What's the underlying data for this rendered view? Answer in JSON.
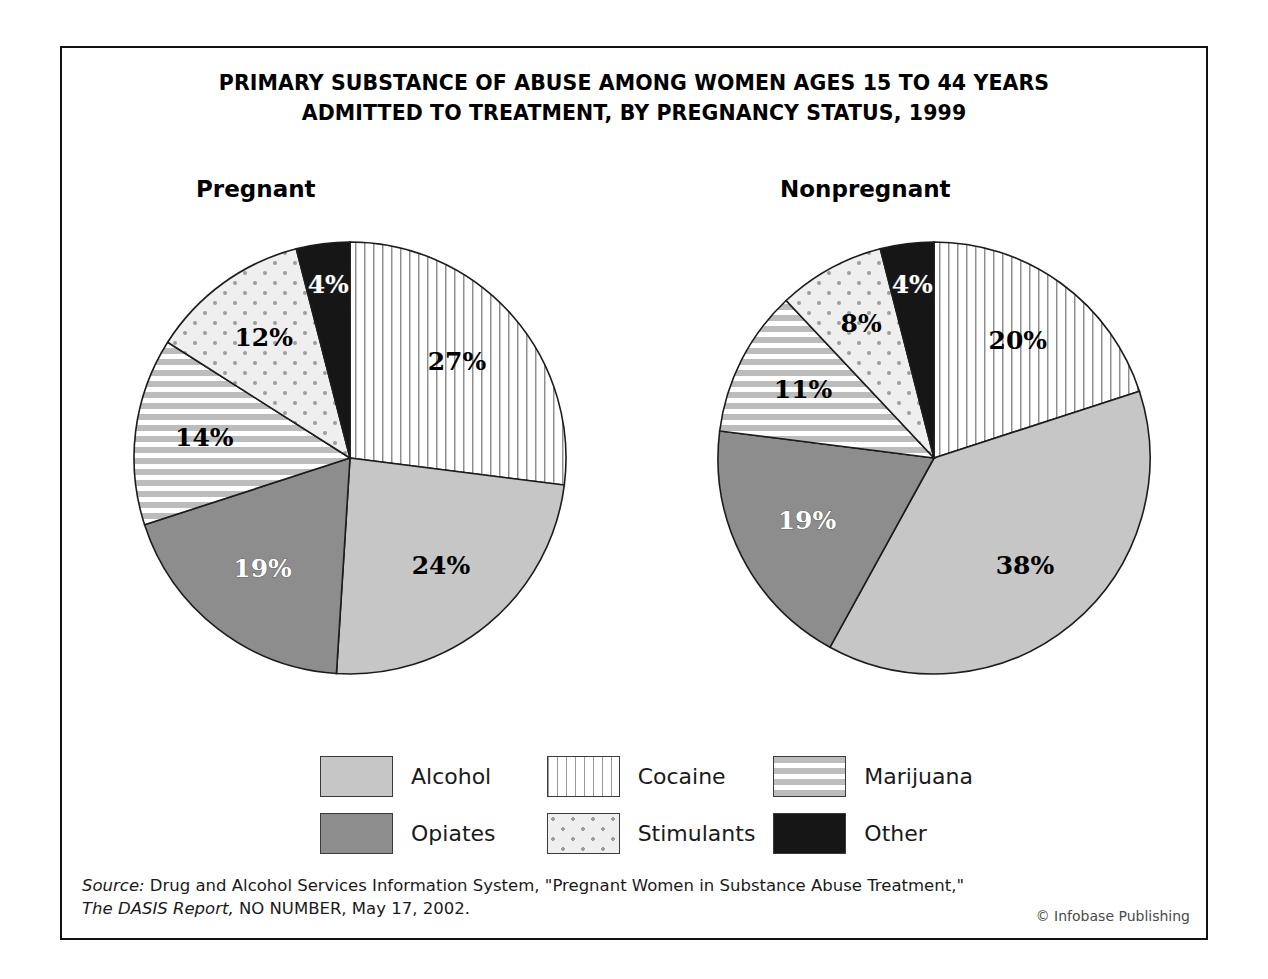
{
  "figure": {
    "title_line1": "PRIMARY SUBSTANCE OF ABUSE AMONG WOMEN AGES 15 TO 44 YEARS",
    "title_line2": "ADMITTED TO TREATMENT, BY PREGNANCY STATUS, 1999",
    "source_line1_label": "Source:",
    "source_line1_text": " Drug and Alcohol Services Information System, \"Pregnant Women in Substance Abuse Treatment,\"",
    "source_line2_italic": "The DASIS Report,",
    "source_line2_text": " NO NUMBER, May 17, 2002.",
    "credit": "© Infobase Publishing"
  },
  "legend": {
    "items": [
      {
        "label": "Alcohol",
        "swatch": "alcohol",
        "color": "#c6c6c6"
      },
      {
        "label": "Cocaine",
        "swatch": "cocaine",
        "color": "#ffffff"
      },
      {
        "label": "Marijuana",
        "swatch": "marijuana",
        "color": "#bdbdbd"
      },
      {
        "label": "Opiates",
        "swatch": "opiates",
        "color": "#8d8d8d"
      },
      {
        "label": "Stimulants",
        "swatch": "stimulants",
        "color": "#efefef"
      },
      {
        "label": "Other",
        "swatch": "other",
        "color": "#161616"
      }
    ]
  },
  "chart_data": {
    "type": "pie",
    "title": "PRIMARY SUBSTANCE OF ABUSE AMONG WOMEN AGES 15 TO 44 YEARS ADMITTED TO TREATMENT, BY PREGNANCY STATUS, 1999",
    "units": "percent",
    "legend_position": "bottom",
    "start_angle_deg": 0,
    "direction": "clockwise",
    "categories": [
      "Cocaine",
      "Alcohol",
      "Opiates",
      "Marijuana",
      "Stimulants",
      "Other"
    ],
    "charts": [
      {
        "name": "Pregnant",
        "title": "Pregnant",
        "values": [
          27,
          24,
          19,
          14,
          12,
          4
        ],
        "labels": [
          "27%",
          "24%",
          "19%",
          "14%",
          "12%",
          "4%"
        ],
        "label_colors": [
          "dark",
          "dark",
          "light",
          "dark",
          "dark",
          "light"
        ]
      },
      {
        "name": "Nonpregnant",
        "title": "Nonpregnant",
        "values": [
          20,
          38,
          19,
          11,
          8,
          4
        ],
        "labels": [
          "20%",
          "38%",
          "19%",
          "11%",
          "8%",
          "4%"
        ],
        "label_colors": [
          "dark",
          "dark",
          "light",
          "dark",
          "dark",
          "light"
        ]
      }
    ]
  }
}
